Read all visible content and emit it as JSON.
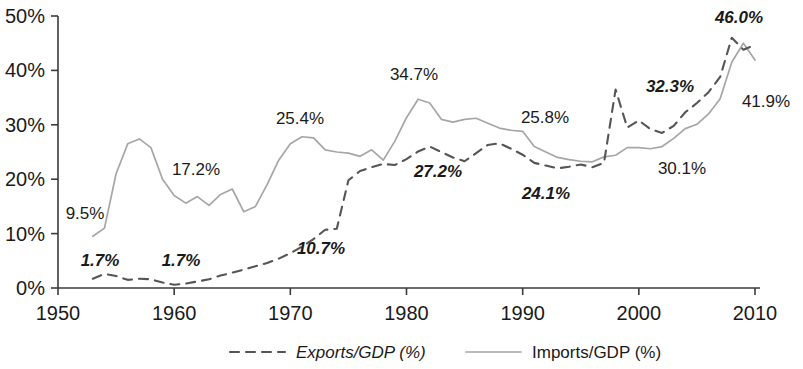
{
  "chart_data": {
    "type": "line",
    "title": "",
    "subtitle": "",
    "xlabel": "",
    "ylabel": "",
    "xlim": [
      1950,
      2010
    ],
    "ylim": [
      0,
      50
    ],
    "grid": false,
    "legend_position": "bottom",
    "x_ticks": [
      "1950",
      "1960",
      "1970",
      "1980",
      "1990",
      "2000",
      "2010"
    ],
    "x_tick_values": [
      1950,
      1960,
      1970,
      1980,
      1990,
      2000,
      2010
    ],
    "y_ticks": [
      "0%",
      "10%",
      "20%",
      "30%",
      "40%",
      "50%"
    ],
    "y_tick_values": [
      0,
      10,
      20,
      30,
      40,
      50
    ],
    "x": [
      1953,
      1954,
      1955,
      1956,
      1957,
      1958,
      1959,
      1960,
      1961,
      1962,
      1963,
      1964,
      1965,
      1966,
      1967,
      1968,
      1969,
      1970,
      1971,
      1972,
      1973,
      1974,
      1975,
      1976,
      1977,
      1978,
      1979,
      1980,
      1981,
      1982,
      1983,
      1984,
      1985,
      1986,
      1987,
      1988,
      1989,
      1990,
      1991,
      1992,
      1993,
      1994,
      1995,
      1996,
      1997,
      1998,
      1999,
      2000,
      2001,
      2002,
      2003,
      2004,
      2005,
      2006,
      2007,
      2008,
      2009,
      2010
    ],
    "series": [
      {
        "name": "Exports/GDP (%)",
        "style": "dashed",
        "color": "#555555",
        "values": [
          1.7,
          2.6,
          2.2,
          1.5,
          1.7,
          1.6,
          1.0,
          0.6,
          0.8,
          1.2,
          1.6,
          2.3,
          2.8,
          3.4,
          4.0,
          4.6,
          5.4,
          6.4,
          7.6,
          9.0,
          10.7,
          10.9,
          19.8,
          21.5,
          22.2,
          22.8,
          22.6,
          23.7,
          25.1,
          26.0,
          25.0,
          24.0,
          23.3,
          24.8,
          26.3,
          26.6,
          25.6,
          24.5,
          23.0,
          22.5,
          22.0,
          22.3,
          22.7,
          22.2,
          23.0,
          36.5,
          29.5,
          30.8,
          29.2,
          28.5,
          29.8,
          32.3,
          34.0,
          36.0,
          38.8,
          46.0,
          43.8,
          44.7
        ]
      },
      {
        "name": "Imports/GDP (%)",
        "style": "solid",
        "color": "#a6a6a6",
        "values": [
          9.5,
          11.0,
          21.0,
          26.5,
          27.4,
          25.8,
          20.0,
          17.0,
          15.6,
          16.8,
          15.2,
          17.2,
          18.2,
          14.0,
          15.0,
          19.0,
          23.5,
          26.5,
          27.8,
          27.6,
          25.4,
          25.0,
          24.8,
          24.2,
          25.4,
          23.5,
          27.0,
          31.3,
          34.7,
          34.0,
          31.0,
          30.5,
          31.0,
          31.2,
          30.3,
          29.4,
          29.0,
          28.8,
          26.0,
          25.0,
          24.0,
          23.6,
          23.3,
          23.2,
          24.1,
          24.4,
          25.8,
          25.8,
          25.6,
          26.0,
          27.5,
          29.3,
          30.1,
          32.0,
          34.8,
          41.5,
          45.0,
          41.9
        ]
      }
    ],
    "annotations": [
      {
        "text": "9.5%",
        "series": "imports",
        "x": 1953.0,
        "y": 9.5,
        "label_x": 85,
        "label_y": 219
      },
      {
        "text": "17.2%",
        "series": "imports",
        "x": 1964.0,
        "y": 17.2,
        "label_x": 196,
        "label_y": 175
      },
      {
        "text": "25.4%",
        "series": "imports",
        "x": 1973.0,
        "y": 25.4,
        "label_x": 300,
        "label_y": 124
      },
      {
        "text": "34.7%",
        "series": "imports",
        "x": 1981.0,
        "y": 34.7,
        "label_x": 414,
        "label_y": 80
      },
      {
        "text": "25.8%",
        "series": "imports",
        "x": 1990.0,
        "y": 25.8,
        "label_x": 545,
        "label_y": 123
      },
      {
        "text": "30.1%",
        "series": "imports",
        "x": 2005.0,
        "y": 30.1,
        "label_x": 682,
        "label_y": 174
      },
      {
        "text": "41.9%",
        "series": "imports",
        "x": 2010.0,
        "y": 41.9,
        "label_x": 766,
        "label_y": 107
      },
      {
        "text": "1.7%",
        "series": "exports",
        "x": 1953.0,
        "y": 1.7,
        "label_x": 100,
        "label_y": 266
      },
      {
        "text": "1.7%",
        "series": "exports",
        "x": 1960.0,
        "y": 1.7,
        "label_x": 181,
        "label_y": 266
      },
      {
        "text": "10.7%",
        "series": "exports",
        "x": 1973.0,
        "y": 10.7,
        "label_x": 321,
        "label_y": 254
      },
      {
        "text": "27.2%",
        "series": "exports",
        "x": 1982.0,
        "y": 27.2,
        "label_x": 438,
        "label_y": 177
      },
      {
        "text": "24.1%",
        "series": "exports",
        "x": 1993.0,
        "y": 24.1,
        "label_x": 546,
        "label_y": 199
      },
      {
        "text": "32.3%",
        "series": "exports",
        "x": 2004.0,
        "y": 32.3,
        "label_x": 670,
        "label_y": 92
      },
      {
        "text": "46.0%",
        "series": "exports",
        "x": 2008.0,
        "y": 46.0,
        "label_x": 739,
        "label_y": 23
      }
    ]
  },
  "legend": {
    "items": [
      {
        "label": "Exports/GDP (%)",
        "style": "dashed",
        "color": "#555555"
      },
      {
        "label": "Imports/GDP (%)",
        "style": "solid",
        "color": "#a6a6a6"
      }
    ]
  },
  "colors": {
    "exports": "#555555",
    "imports": "#a6a6a6",
    "axis": "#3b3b3b",
    "text": "#1a1a1a",
    "background": "#ffffff"
  }
}
